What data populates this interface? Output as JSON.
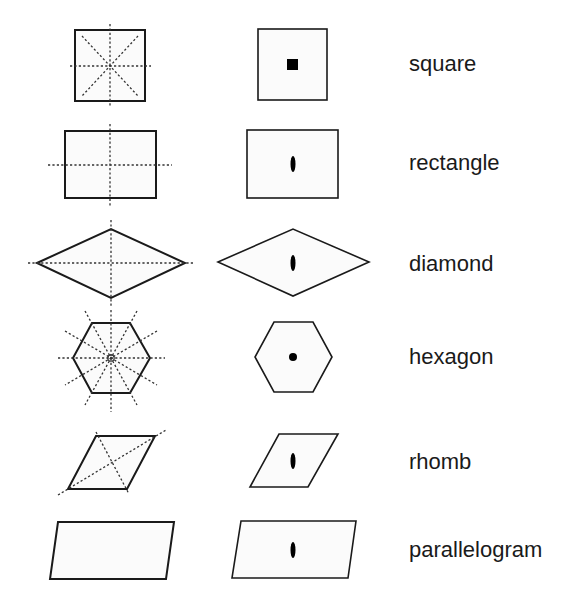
{
  "diagram": {
    "title": "",
    "columns": [
      "symmetry-lines",
      "rotation-center",
      "name"
    ],
    "rows": [
      {
        "name": "square",
        "symmetry_lines": 4,
        "rotation_mark": "square",
        "label_top": 52
      },
      {
        "name": "rectangle",
        "symmetry_lines": 2,
        "rotation_mark": "lens",
        "label_top": 151
      },
      {
        "name": "diamond",
        "symmetry_lines": 2,
        "rotation_mark": "lens",
        "label_top": 254
      },
      {
        "name": "hexagon",
        "symmetry_lines": 6,
        "rotation_mark": "dot",
        "label_top": 349
      },
      {
        "name": "rhomb",
        "symmetry_lines": 0,
        "rotation_mark": "lens",
        "label_top": 452
      },
      {
        "name": "parallelogram",
        "symmetry_lines": 0,
        "rotation_mark": "lens",
        "label_top": 541
      }
    ]
  }
}
